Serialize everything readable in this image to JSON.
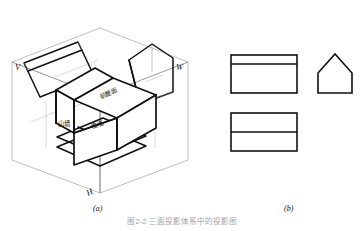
{
  "figure": {
    "caption": "图2-2 三面投影体系中的投影图",
    "panels": [
      {
        "id": "a",
        "label": "(a)"
      },
      {
        "id": "b",
        "label": "(b)"
      }
    ]
  },
  "projection_system": {
    "axes": [
      {
        "name": "V",
        "label": "V",
        "meaning": "vertical-projection-plane"
      },
      {
        "name": "W",
        "label": "W",
        "meaning": "side-projection-plane"
      },
      {
        "name": "H",
        "label": "H",
        "meaning": "horizontal-projection-plane"
      }
    ],
    "face_labels": [
      {
        "id": "front-roof",
        "label": "前屋面"
      },
      {
        "id": "gable-wall",
        "label": "山墙"
      },
      {
        "id": "front-wall",
        "label": "檐墙"
      }
    ]
  },
  "orthographic_views": {
    "front_view": {
      "name": "front-view",
      "x": 231,
      "y": 55,
      "width": 66,
      "height": 38,
      "divider_y": 64
    },
    "top_view": {
      "name": "top-view",
      "x": 231,
      "y": 113,
      "width": 66,
      "height": 38,
      "divider_y": 132
    },
    "side_view": {
      "name": "side-view",
      "points": "318,73 318,93 352,93 352,73 335,54",
      "apex_x": 335,
      "apex_y": 54,
      "eave_y": 73,
      "base_y": 93
    }
  },
  "style": {
    "line_color": "#111111",
    "construction_color": "#8a8a8a",
    "background": "#ffffff",
    "heavy_width": 1.6,
    "light_width": 0.5
  }
}
